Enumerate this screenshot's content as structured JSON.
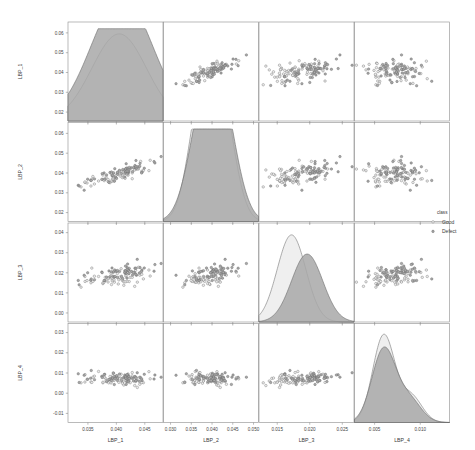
{
  "chart_data": {
    "type": "scatter",
    "title": "",
    "plot_kind": "pairs-scatter-plot-matrix",
    "variables": [
      "LBP_1",
      "LBP_2",
      "LBP_3",
      "LBP_4"
    ],
    "diagonal_kind": "kde-density",
    "grid": false,
    "legend": {
      "title": "class",
      "position": "right",
      "entries": [
        {
          "label": "Good",
          "color": "#e8e8e8",
          "marker": "point"
        },
        {
          "label": "Defect",
          "color": "#a0a0a0",
          "marker": "point"
        }
      ]
    },
    "axes": [
      {
        "name": "LBP_1",
        "xlabel": "LBP_1",
        "ylabel": "LBP_1",
        "xticks": [
          0.035,
          0.04,
          0.045
        ],
        "xticklabels": [
          "0.035",
          "0.040",
          "0.045"
        ],
        "yticks": [
          0.02,
          0.03,
          0.04,
          0.05,
          0.06
        ],
        "yticklabels": [
          "0.02",
          "0.03",
          "0.04",
          "0.05",
          "0.06"
        ],
        "xlim": [
          0.0315,
          0.0482
        ],
        "ylim": [
          0.0155,
          0.0655
        ]
      },
      {
        "name": "LBP_2",
        "xlabel": "LBP_2",
        "ylabel": "LBP_2",
        "xticks": [
          0.03,
          0.035,
          0.04,
          0.045,
          0.05
        ],
        "xticklabels": [
          "0.030",
          "0.035",
          "0.040",
          "0.045",
          "0.050"
        ],
        "yticks": [
          0.02,
          0.03,
          0.04,
          0.05,
          0.06
        ],
        "yticklabels": [
          "0.02",
          "0.03",
          "0.04",
          "0.05",
          "0.06"
        ],
        "xlim": [
          0.0283,
          0.0512
        ],
        "ylim": [
          0.0155,
          0.0655
        ]
      },
      {
        "name": "LBP_3",
        "xlabel": "LBP_3",
        "ylabel": "LBP_3",
        "xticks": [
          0.015,
          0.02,
          0.025
        ],
        "xticklabels": [
          "0.015",
          "0.020",
          "0.025"
        ],
        "yticks": [
          0.0,
          0.01,
          0.02,
          0.03,
          0.04
        ],
        "yticklabels": [
          "0.00",
          "0.01",
          "0.02",
          "0.03",
          "0.04"
        ],
        "xlim": [
          0.0122,
          0.0268
        ],
        "ylim": [
          -0.0045,
          0.0448
        ]
      },
      {
        "name": "LBP_4",
        "xlabel": "LBP_4",
        "ylabel": "LBP_4",
        "xticks": [
          0.005,
          0.01
        ],
        "xticklabels": [
          "0.005",
          "0.010"
        ],
        "yticks": [
          -0.01,
          0.0,
          0.01,
          0.02,
          0.03
        ],
        "yticklabels": [
          "-0.01",
          "0.00",
          "0.01",
          "0.02",
          "0.03"
        ],
        "xlim": [
          0.0028,
          0.0132
        ],
        "ylim": [
          -0.0145,
          0.0345
        ]
      }
    ],
    "diagonal_densities": [
      {
        "variable": "LBP_1",
        "series": [
          {
            "name": "Good",
            "peaks": [
              {
                "x": 0.0405,
                "height": 1.0
              }
            ],
            "spread": 0.0048
          },
          {
            "name": "Defect",
            "peaks": [
              {
                "x": 0.0396,
                "height": 0.78
              },
              {
                "x": 0.0425,
                "height": 0.7
              }
            ],
            "spread": 0.0052
          }
        ]
      },
      {
        "variable": "LBP_2",
        "series": [
          {
            "name": "Good",
            "peaks": [
              {
                "x": 0.0368,
                "height": 0.93
              },
              {
                "x": 0.04,
                "height": 1.0
              },
              {
                "x": 0.0432,
                "height": 0.8
              }
            ],
            "spread": 0.003
          },
          {
            "name": "Defect",
            "peaks": [
              {
                "x": 0.0372,
                "height": 0.8
              },
              {
                "x": 0.0404,
                "height": 0.74
              },
              {
                "x": 0.0431,
                "height": 0.77
              }
            ],
            "spread": 0.0035
          }
        ]
      },
      {
        "variable": "LBP_3",
        "series": [
          {
            "name": "Good",
            "peaks": [
              {
                "x": 0.0172,
                "height": 1.0
              }
            ],
            "spread": 0.0022
          },
          {
            "name": "Defect",
            "peaks": [
              {
                "x": 0.0196,
                "height": 0.78
              }
            ],
            "spread": 0.0024
          }
        ]
      },
      {
        "variable": "LBP_4",
        "series": [
          {
            "name": "Good",
            "peaks": [
              {
                "x": 0.006,
                "height": 1.0
              },
              {
                "x": 0.009,
                "height": 0.3
              }
            ],
            "spread": 0.0012
          },
          {
            "name": "Defect",
            "peaks": [
              {
                "x": 0.006,
                "height": 0.84
              },
              {
                "x": 0.0088,
                "height": 0.26
              }
            ],
            "spread": 0.0013
          }
        ]
      }
    ],
    "scatter_relations": [
      {
        "x": "LBP_2",
        "y": "LBP_1",
        "correlation": "positive-strong",
        "n": 120
      },
      {
        "x": "LBP_3",
        "y": "LBP_1",
        "correlation": "weak-positive",
        "n": 120
      },
      {
        "x": "LBP_4",
        "y": "LBP_1",
        "correlation": "weak-negative",
        "n": 120
      },
      {
        "x": "LBP_1",
        "y": "LBP_2",
        "correlation": "positive-strong",
        "n": 120
      },
      {
        "x": "LBP_3",
        "y": "LBP_2",
        "correlation": "weak-positive",
        "n": 120
      },
      {
        "x": "LBP_4",
        "y": "LBP_2",
        "correlation": "weak-negative",
        "n": 120
      },
      {
        "x": "LBP_1",
        "y": "LBP_3",
        "correlation": "weak-positive",
        "n": 120
      },
      {
        "x": "LBP_2",
        "y": "LBP_3",
        "correlation": "weak-positive",
        "n": 120
      },
      {
        "x": "LBP_4",
        "y": "LBP_3",
        "correlation": "positive",
        "n": 120
      },
      {
        "x": "LBP_1",
        "y": "LBP_4",
        "correlation": "weak-negative",
        "n": 120
      },
      {
        "x": "LBP_2",
        "y": "LBP_4",
        "correlation": "weak-negative",
        "n": 120
      },
      {
        "x": "LBP_3",
        "y": "LBP_4",
        "correlation": "positive",
        "n": 120
      }
    ]
  }
}
